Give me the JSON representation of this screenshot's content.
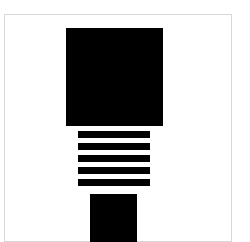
{
  "figure": {
    "canvas": {
      "width": 250,
      "height": 242,
      "background_color": "#ffffff",
      "border_color": "#d8d8d8",
      "border_width": 1,
      "frame_left": 4,
      "frame_top": 14,
      "frame_width": 228,
      "frame_height": 228
    },
    "glyph": {
      "fill_color": "#000000",
      "parts": [
        {
          "name": "head-square",
          "label": "Large upper square",
          "x": 66,
          "y": 28,
          "width": 97,
          "height": 98
        },
        {
          "name": "stripe-1",
          "label": "Bar 1",
          "x": 78,
          "y": 131,
          "width": 72,
          "height": 7
        },
        {
          "name": "stripe-2",
          "label": "Bar 2",
          "x": 78,
          "y": 143,
          "width": 72,
          "height": 7
        },
        {
          "name": "stripe-3",
          "label": "Bar 3",
          "x": 78,
          "y": 155,
          "width": 72,
          "height": 7
        },
        {
          "name": "stripe-4",
          "label": "Bar 4",
          "x": 78,
          "y": 167,
          "width": 72,
          "height": 7
        },
        {
          "name": "stripe-5",
          "label": "Bar 5",
          "x": 78,
          "y": 179,
          "width": 72,
          "height": 7
        },
        {
          "name": "tail-square",
          "label": "Small lower square",
          "x": 90,
          "y": 194,
          "width": 47,
          "height": 48
        }
      ],
      "stripe_count": 5,
      "stripe_pitch": 12
    }
  }
}
